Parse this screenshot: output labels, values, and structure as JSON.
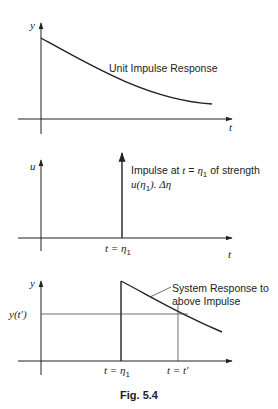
{
  "figure": {
    "caption": "Fig. 5.4",
    "panels": [
      {
        "id": "unit-impulse-response",
        "y_axis_label": "y",
        "x_axis_label": "t",
        "annotation": "Unit Impulse Response"
      },
      {
        "id": "input-impulse",
        "y_axis_label": "u",
        "x_axis_label": "t",
        "annotation_line1_prefix": "Impulse at ",
        "annotation_line1_var": "t",
        "annotation_line1_eq": " = ",
        "annotation_line1_eta": "η",
        "annotation_line1_sub": "1",
        "annotation_line1_suffix": " of strength",
        "annotation_line2": "u(η",
        "annotation_line2_sub": "1",
        "annotation_line2_suffix": "). Δη",
        "tick_label_var": "t = η",
        "tick_label_sub": "1"
      },
      {
        "id": "system-response",
        "y_axis_label": "y",
        "y_value_label": "y(t′)",
        "annotation_line1": "System Response to",
        "annotation_line2": "above Impulse",
        "tick1_label": "t = η",
        "tick1_sub": "1",
        "tick2_label": "t = t′"
      }
    ]
  }
}
